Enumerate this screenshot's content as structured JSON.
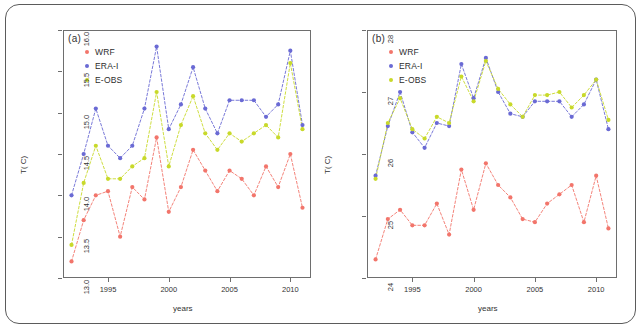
{
  "figure": {
    "series_colors": {
      "WRF": "#f2756b",
      "ERA-I": "#6a6ad4",
      "E-OBS": "#c8d92a"
    },
    "legend_labels": [
      "WRF",
      "ERA-I",
      "E-OBS"
    ],
    "xlabel": "years",
    "ylabel": "T( C)",
    "xticks": [
      "1995",
      "2000",
      "2005",
      "2010"
    ],
    "xtick_values": [
      1995,
      2000,
      2005,
      2010
    ],
    "xlim": [
      1991.3,
      2011.7
    ]
  },
  "chart_data": [
    {
      "type": "line",
      "panel": "a",
      "tag": "(a)",
      "title": "",
      "xlabel": "years",
      "ylabel": "T( C)",
      "x": [
        1992,
        1993,
        1994,
        1995,
        1996,
        1997,
        1998,
        1999,
        2000,
        2001,
        2002,
        2003,
        2004,
        2005,
        2006,
        2007,
        2008,
        2009,
        2010,
        2011
      ],
      "xticks": [
        1995,
        2000,
        2005,
        2010
      ],
      "yticks": [
        13.0,
        13.5,
        14.0,
        14.5,
        15.0,
        15.5,
        16.0
      ],
      "ytick_labels": [
        "13.0",
        "13.5",
        "14.0",
        "14.5",
        "15.0",
        "15.5",
        "16.0"
      ],
      "ylim": [
        13.0,
        16.0
      ],
      "xlim": [
        1991.3,
        2011.7
      ],
      "grid": false,
      "legend_position": "top-left",
      "series": [
        {
          "name": "WRF",
          "color": "#f2756b",
          "values": [
            13.2,
            13.7,
            14.0,
            14.05,
            13.5,
            14.1,
            13.95,
            14.7,
            13.8,
            14.1,
            14.55,
            14.3,
            14.05,
            14.3,
            14.2,
            14.0,
            14.35,
            14.1,
            14.5,
            13.85
          ]
        },
        {
          "name": "ERA-I",
          "color": "#6a6ad4",
          "values": [
            14.0,
            14.5,
            15.05,
            14.6,
            14.45,
            14.6,
            15.05,
            15.8,
            14.8,
            15.1,
            15.55,
            15.05,
            14.75,
            15.15,
            15.15,
            15.15,
            14.95,
            15.1,
            15.75,
            14.85
          ]
        },
        {
          "name": "E-OBS",
          "color": "#c8d92a",
          "values": [
            13.4,
            14.15,
            14.6,
            14.2,
            14.2,
            14.35,
            14.45,
            15.25,
            14.35,
            14.85,
            15.2,
            14.75,
            14.55,
            14.75,
            14.65,
            14.75,
            14.85,
            14.7,
            15.6,
            14.8
          ]
        }
      ]
    },
    {
      "type": "line",
      "panel": "b",
      "tag": "(b)",
      "title": "",
      "xlabel": "years",
      "ylabel": "T( C)",
      "x": [
        1992,
        1993,
        1994,
        1995,
        1996,
        1997,
        1998,
        1999,
        2000,
        2001,
        2002,
        2003,
        2004,
        2005,
        2006,
        2007,
        2008,
        2009,
        2010,
        2011
      ],
      "xticks": [
        1995,
        2000,
        2005,
        2010
      ],
      "yticks": [
        24,
        25,
        26,
        27,
        28
      ],
      "ytick_labels": [
        "24",
        "25",
        "26",
        "27",
        "28"
      ],
      "ylim": [
        24.0,
        28.0
      ],
      "xlim": [
        1991.3,
        2011.7
      ],
      "grid": false,
      "legend_position": "top-left",
      "series": [
        {
          "name": "WRF",
          "color": "#f2756b",
          "values": [
            24.3,
            24.95,
            25.1,
            24.85,
            24.85,
            25.2,
            24.7,
            25.75,
            25.1,
            25.85,
            25.5,
            25.3,
            24.95,
            24.9,
            25.2,
            25.35,
            25.5,
            24.9,
            25.65,
            24.8
          ]
        },
        {
          "name": "ERA-I",
          "color": "#6a6ad4",
          "values": [
            25.65,
            26.45,
            27.0,
            26.35,
            26.1,
            26.5,
            26.45,
            27.45,
            26.9,
            27.55,
            27.0,
            26.65,
            26.6,
            26.85,
            26.85,
            26.85,
            26.6,
            26.8,
            27.2,
            26.4
          ]
        },
        {
          "name": "E-OBS",
          "color": "#c8d92a",
          "values": [
            25.6,
            26.5,
            26.9,
            26.4,
            26.25,
            26.6,
            26.5,
            27.25,
            26.85,
            27.5,
            27.05,
            26.8,
            26.6,
            26.95,
            26.95,
            27.0,
            26.75,
            26.95,
            27.2,
            26.55
          ]
        }
      ]
    }
  ]
}
